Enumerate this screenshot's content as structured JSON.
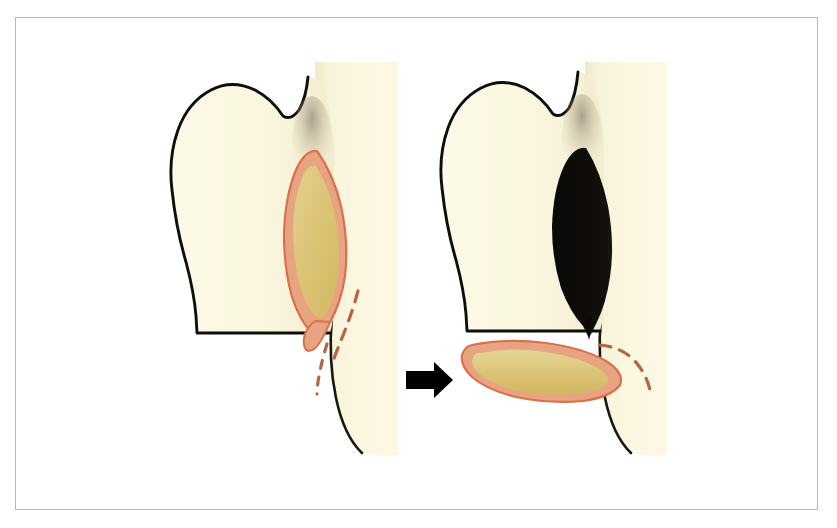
{
  "figure": {
    "kind": "surgical-illustration",
    "title": "Flap harvest and rotation",
    "caption": "",
    "panel_count": 2,
    "transition_symbol": "→",
    "frame": {
      "border_color": "#b9b9b9",
      "background": "#ffffff",
      "x": 15,
      "y": 17,
      "width": 803,
      "height": 493
    },
    "palette": {
      "tissue_cream": "#faf6de",
      "tissue_cream_shadow": "#f2ecd2",
      "strip_cream": "#fbf7e0",
      "outline_black": "#111111",
      "defect_black": "#0c0a08",
      "flap_border_coral": "#e07a55",
      "flap_band_salmon": "#e8a382",
      "flap_core_tan": "#dbc26f",
      "flap_core_tan_light": "#e3d08a",
      "dashed_incision": "#b5663f",
      "arrow_black": "#000000",
      "page_white": "#ffffff"
    },
    "panels": [
      {
        "id": "panel-before",
        "label": "before",
        "position": "left",
        "parts": [
          {
            "name": "vertical-strip",
            "role": "adjacent-tissue-column",
            "fill": "#fbf7e0"
          },
          {
            "name": "organ-body",
            "role": "organ-outline",
            "fill": "#faf6de",
            "stroke": "#111111"
          },
          {
            "name": "flap-outline",
            "role": "planned-flap",
            "border": "#e07a55",
            "band": "#e8a382",
            "core": "#dbc26f"
          },
          {
            "name": "incision-dashes",
            "role": "planned-incision",
            "stroke": "#b5663f",
            "count": 2
          }
        ]
      },
      {
        "id": "panel-after",
        "label": "after",
        "position": "right",
        "parts": [
          {
            "name": "vertical-strip",
            "role": "adjacent-tissue-column",
            "fill": "#fbf7e0"
          },
          {
            "name": "organ-body",
            "role": "organ-outline",
            "fill": "#faf6de",
            "stroke": "#111111"
          },
          {
            "name": "defect-void",
            "role": "donor-site-defect",
            "fill": "#0c0a08"
          },
          {
            "name": "flap-rotated",
            "role": "transposed-flap",
            "border": "#e07a55",
            "band": "#e8a382",
            "core": "#dbc26f"
          },
          {
            "name": "incision-dashes",
            "role": "residual-incision",
            "stroke": "#b5663f",
            "count": 1
          }
        ]
      }
    ],
    "arrow": {
      "name": "transition-arrow",
      "direction": "right",
      "color": "#000000",
      "x": 405,
      "y": 362,
      "width": 48,
      "height": 36
    }
  }
}
